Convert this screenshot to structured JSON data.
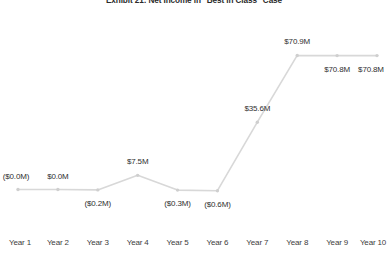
{
  "chart_data": {
    "type": "line",
    "title": "Exhibit 21: Net Income in \"Best in Class\" Case",
    "xlabel": "",
    "ylabel": "",
    "categories": [
      "Year 1",
      "Year 2",
      "Year 3",
      "Year 4",
      "Year 5",
      "Year 6",
      "Year 7",
      "Year 8",
      "Year 9",
      "Year 10"
    ],
    "values": [
      -0.0,
      0.0,
      -0.2,
      7.5,
      -0.3,
      -0.6,
      35.6,
      70.9,
      70.8,
      70.8
    ],
    "data_labels": [
      "($0.0M)",
      "$0.0M",
      "($0.2M)",
      "$7.5M",
      "($0.3M)",
      "($0.6M)",
      "$35.6M",
      "$70.9M",
      "$70.8M",
      "$70.8M"
    ],
    "label_positions": [
      "above",
      "above",
      "below",
      "above",
      "below",
      "below",
      "above",
      "above",
      "below",
      "below"
    ],
    "ylim": [
      -5,
      78
    ],
    "grid": false,
    "legend": false,
    "line_color": "#d8d8d8",
    "marker_color": "#cfcfcf",
    "text_color": "#2f2f2f"
  }
}
